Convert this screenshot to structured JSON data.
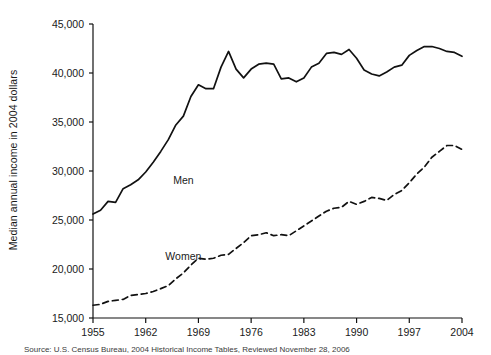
{
  "figure": {
    "ylabel": "Median annual income in 2004 dollars",
    "source_note": "Source: U.S. Census Bureau, 2004 Historical Income Tables, Reviewed November 28, 2006",
    "line_color": "#111111",
    "background_color": "#ffffff"
  },
  "chart_data": {
    "type": "line",
    "title": "",
    "xlabel": "",
    "ylabel": "Median annual income in 2004 dollars",
    "xlim": [
      1955,
      2004
    ],
    "ylim": [
      15000,
      45000
    ],
    "xticks": [
      "1955",
      "1962",
      "1969",
      "1976",
      "1983",
      "1990",
      "1997",
      "2004"
    ],
    "xtick_values": [
      1955,
      1962,
      1969,
      1976,
      1983,
      1990,
      1997,
      2004
    ],
    "yticks": [
      "15,000",
      "20,000",
      "25,000",
      "30,000",
      "35,000",
      "40,000",
      "45,000"
    ],
    "ytick_values": [
      15000,
      20000,
      25000,
      30000,
      35000,
      40000,
      45000
    ],
    "grid": false,
    "legend_position": "inline-annotation",
    "x": [
      1955,
      1956,
      1957,
      1958,
      1959,
      1960,
      1961,
      1962,
      1963,
      1964,
      1965,
      1966,
      1967,
      1968,
      1969,
      1970,
      1971,
      1972,
      1973,
      1974,
      1975,
      1976,
      1977,
      1978,
      1979,
      1980,
      1981,
      1982,
      1983,
      1984,
      1985,
      1986,
      1987,
      1988,
      1989,
      1990,
      1991,
      1992,
      1993,
      1994,
      1995,
      1996,
      1997,
      1998,
      1999,
      2000,
      2001,
      2002,
      2003,
      2004
    ],
    "series": [
      {
        "name": "Men",
        "label": "Men",
        "style": "solid",
        "label_position": {
          "x": 1967,
          "y": 28700
        },
        "values": [
          25600,
          26000,
          26900,
          26800,
          28200,
          28600,
          29100,
          29900,
          30900,
          32000,
          33200,
          34700,
          35600,
          37600,
          38800,
          38400,
          38400,
          40600,
          42200,
          40400,
          39500,
          40400,
          40900,
          41000,
          40900,
          39400,
          39500,
          39100,
          39500,
          40600,
          41000,
          42000,
          42100,
          41900,
          42400,
          41500,
          40300,
          39900,
          39700,
          40100,
          40600,
          40800,
          41800,
          42300,
          42700,
          42700,
          42500,
          42200,
          42100,
          41700
        ]
      },
      {
        "name": "Women",
        "label": "Women",
        "style": "dashed",
        "label_position": {
          "x": 1967,
          "y": 20900
        },
        "values": [
          16300,
          16400,
          16700,
          16800,
          16900,
          17300,
          17400,
          17500,
          17700,
          18000,
          18300,
          19000,
          19600,
          20400,
          21100,
          21000,
          21100,
          21400,
          21500,
          22100,
          22700,
          23400,
          23500,
          23700,
          23400,
          23500,
          23400,
          23900,
          24400,
          24900,
          25400,
          25900,
          26200,
          26300,
          26900,
          26600,
          26900,
          27300,
          27200,
          27000,
          27600,
          28000,
          28800,
          29700,
          30400,
          31400,
          32000,
          32600,
          32600,
          32200
        ]
      }
    ]
  }
}
